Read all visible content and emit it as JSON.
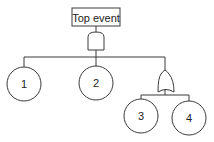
{
  "diagram": {
    "type": "fault-tree",
    "top_event": {
      "label": "Top event"
    },
    "top_gate": {
      "type": "AND"
    },
    "sub_gate": {
      "type": "OR"
    },
    "basic_events": [
      {
        "label": "1"
      },
      {
        "label": "2"
      },
      {
        "label": "3"
      },
      {
        "label": "4"
      }
    ],
    "colors": {
      "stroke": "#3a3a3a",
      "background": "#ffffff",
      "text": "#222222"
    }
  }
}
